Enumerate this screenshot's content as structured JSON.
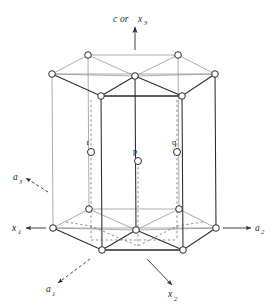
{
  "figure": {
    "name": "hexagonal-close-packed-unit-cell",
    "background_color": "#ffffff",
    "line_color": "#2b2b2b",
    "line_color_light": "#7a7a7a",
    "atom_fill": "#ffffff",
    "atom_stroke": "#2b2b2b"
  },
  "axes": {
    "top": {
      "label_main": "c",
      "label_or": "or",
      "label_secondary": "x",
      "label_secondary_sub": "3",
      "direction": "up",
      "arrow_style": "solid"
    },
    "right": {
      "label_main": "a",
      "label_sub": "2",
      "direction": "right",
      "arrow_style": "solid"
    },
    "left": {
      "label_main": "x",
      "label_sub": "1",
      "direction": "left",
      "arrow_style": "solid"
    },
    "upper_left": {
      "label_main": "a",
      "label_sub": "3",
      "direction": "up-left",
      "arrow_style": "dashed"
    },
    "lower_left": {
      "label_main": "a",
      "label_sub": "1",
      "direction": "down-left",
      "arrow_style": "dashed"
    },
    "lower_right": {
      "label_main": "x",
      "label_sub": "2",
      "direction": "down-right",
      "arrow_style": "solid"
    }
  },
  "interior_atoms": [
    {
      "label": "r",
      "x": 91,
      "y": 152,
      "label_x": 88,
      "label_y": 142
    },
    {
      "label": "p",
      "x": 138,
      "y": 161,
      "label_x": 135,
      "label_y": 151
    },
    {
      "label": "q",
      "x": 177,
      "y": 152,
      "label_x": 174,
      "label_y": 142
    }
  ],
  "lattice": {
    "top_hexagon_vertices": [
      {
        "x": 52,
        "y": 74
      },
      {
        "x": 88,
        "y": 55
      },
      {
        "x": 178,
        "y": 55
      },
      {
        "x": 215,
        "y": 74
      },
      {
        "x": 182,
        "y": 96
      },
      {
        "x": 101,
        "y": 96
      }
    ],
    "bottom_hexagon_vertices": [
      {
        "x": 53,
        "y": 228
      },
      {
        "x": 89,
        "y": 209
      },
      {
        "x": 179,
        "y": 209
      },
      {
        "x": 216,
        "y": 228
      },
      {
        "x": 183,
        "y": 250
      },
      {
        "x": 102,
        "y": 250
      }
    ],
    "top_center_atom": {
      "x": 135,
      "y": 76
    },
    "bottom_center_atom": {
      "x": 136,
      "y": 230
    }
  }
}
